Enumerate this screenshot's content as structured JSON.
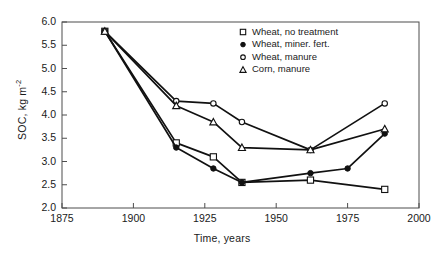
{
  "chart_data": {
    "type": "line",
    "title": "",
    "xlabel": "Time, years",
    "ylabel": "SOC, kg m",
    "ylabel_exponent": "-2",
    "xlim": [
      1875,
      2000
    ],
    "ylim": [
      2.0,
      6.0
    ],
    "xticks": [
      1875,
      1900,
      1925,
      1950,
      1975,
      2000
    ],
    "yticks": [
      "2.0",
      "2.5",
      "3.0",
      "3.5",
      "4.0",
      "4.5",
      "5.0",
      "5.5",
      "6.0"
    ],
    "grid": false,
    "legend_position": "top-right",
    "series": [
      {
        "name": "Wheat, no treatment",
        "marker": "open-square",
        "x": [
          1890,
          1915,
          1928,
          1938,
          1962,
          1988
        ],
        "y": [
          5.8,
          3.4,
          3.1,
          2.55,
          2.6,
          2.4
        ]
      },
      {
        "name": "Wheat, miner. fert.",
        "marker": "filled-circle",
        "x": [
          1890,
          1915,
          1928,
          1938,
          1962,
          1975,
          1988
        ],
        "y": [
          5.8,
          3.3,
          2.85,
          2.55,
          2.75,
          2.85,
          3.6
        ]
      },
      {
        "name": "Wheat, manure",
        "marker": "open-circle",
        "x": [
          1890,
          1915,
          1928,
          1938,
          1962,
          1988
        ],
        "y": [
          5.8,
          4.3,
          4.25,
          3.85,
          3.25,
          4.25
        ]
      },
      {
        "name": "Corn, manure",
        "marker": "open-triangle",
        "x": [
          1890,
          1915,
          1928,
          1938,
          1962,
          1988
        ],
        "y": [
          5.8,
          4.2,
          3.85,
          3.3,
          3.25,
          3.7
        ]
      }
    ]
  },
  "colors": {
    "line": "#111111",
    "axis": "#4d4d4d",
    "text": "#1a1a1a",
    "background": "#ffffff"
  }
}
